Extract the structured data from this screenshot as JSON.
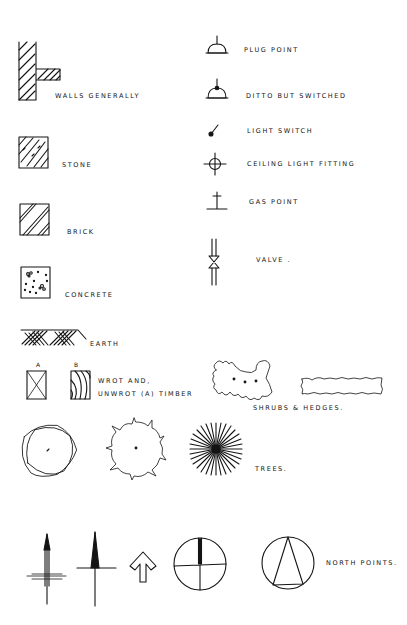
{
  "page": {
    "header_fragment": "· · · · · ·"
  },
  "legend_left": [
    {
      "id": "walls",
      "label": "Walls generally",
      "icon": "wall-hatch-icon"
    },
    {
      "id": "stone",
      "label": "Stone",
      "icon": "stone-hatch-icon"
    },
    {
      "id": "brick",
      "label": "Brick",
      "icon": "brick-hatch-icon"
    },
    {
      "id": "concrete",
      "label": "Concrete",
      "icon": "concrete-speckle-icon"
    },
    {
      "id": "earth",
      "label": "Earth",
      "icon": "earth-hatch-icon"
    }
  ],
  "legend_right": [
    {
      "id": "plug",
      "label": "Plug point",
      "icon": "plug-point-icon"
    },
    {
      "id": "ditto",
      "label": "Ditto but switched",
      "icon": "switched-plug-icon"
    },
    {
      "id": "light_switch",
      "label": "Light switch",
      "icon": "light-switch-icon"
    },
    {
      "id": "ceiling_light",
      "label": "Ceiling light fitting",
      "icon": "ceiling-light-icon"
    },
    {
      "id": "gas",
      "label": "Gas point",
      "icon": "gas-point-icon"
    },
    {
      "id": "valve",
      "label": "Valve .",
      "icon": "valve-icon"
    }
  ],
  "timber": {
    "marker_a": "A",
    "marker_b": "B",
    "label_line1": "Wrot and,",
    "label_line2": "unwrot (a) timber"
  },
  "shrubs": {
    "label": "Shrubs & hedges."
  },
  "trees": {
    "label": "Trees."
  },
  "north_points": {
    "label": "North points."
  }
}
